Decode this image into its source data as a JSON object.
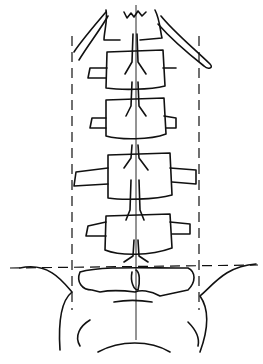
{
  "figure": {
    "type": "anatomical-line-drawing",
    "vertebrae_count": 5,
    "reference_lines": {
      "vertical_dashed": 2,
      "horizontal_dashed": 1,
      "midline": 1
    },
    "colors": {
      "stroke": "#111111",
      "background": "#ffffff"
    }
  }
}
